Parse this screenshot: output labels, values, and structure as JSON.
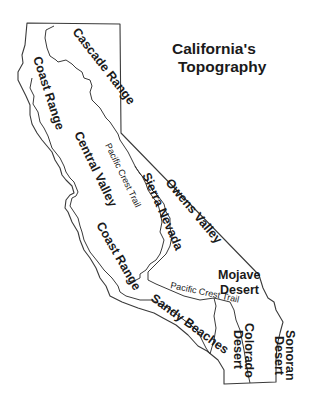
{
  "title": {
    "line1": "California's",
    "line2": "Topography"
  },
  "regions": {
    "cascade_range": "Cascade Range",
    "coast_range_north": "Coast Range",
    "central_valley": "Central Valley",
    "sierra_nevada": "Sierra Nevada",
    "owens_valley": "Owens Valley",
    "coast_range_south": "Coast Range",
    "mojave_desert_line1": "Mojave",
    "mojave_desert_line2": "Desert",
    "sandy_beaches": "Sandy Beaches",
    "colorado_desert_line1": "Colorado",
    "colorado_desert_line2": "Desert",
    "sonoran_desert_line1": "Sonoran",
    "sonoran_desert_line2": "Desert"
  },
  "trails": {
    "pacific_crest_trail_north": "Pacific Crest Trail",
    "pacific_crest_trail_south": "Pacific Crest Trail"
  },
  "colors": {
    "background": "#ffffff",
    "lines": "#3a3a3a",
    "text": "#1a1a1a"
  }
}
